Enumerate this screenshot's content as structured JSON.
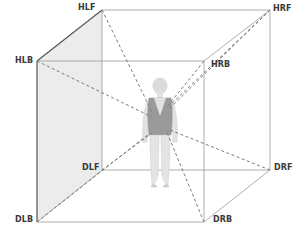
{
  "diagram": {
    "title": "",
    "colors": {
      "edge": "#8a8a8a",
      "edge_dark": "#555555",
      "dashed": "#7a7a7a",
      "left_face_fill": "#ececec",
      "figure_skin": "#e2e2e2",
      "figure_garment": "#9a9a9a",
      "label": "#3a3a3a"
    },
    "corners": {
      "HLF": {
        "label": "HLF",
        "x": 102,
        "y": 10
      },
      "HRF": {
        "label": "HRF",
        "x": 270,
        "y": 10
      },
      "HLB": {
        "label": "HLB",
        "x": 37,
        "y": 61
      },
      "HRB": {
        "label": "HRB",
        "x": 204,
        "y": 61
      },
      "DLF": {
        "label": "DLF",
        "x": 102,
        "y": 170
      },
      "DRF": {
        "label": "DRF",
        "x": 270,
        "y": 170
      },
      "DLB": {
        "label": "DLB",
        "x": 37,
        "y": 222
      },
      "DRB": {
        "label": "DRB",
        "x": 204,
        "y": 222
      }
    },
    "edges": [
      [
        "HLF",
        "HRF"
      ],
      [
        "HLB",
        "HRB"
      ],
      [
        "DLF",
        "DRF"
      ],
      [
        "DLB",
        "DRB"
      ],
      [
        "HLF",
        "HLB"
      ],
      [
        "HRF",
        "HRB"
      ],
      [
        "DLF",
        "DLB"
      ],
      [
        "DRF",
        "DRB"
      ],
      [
        "HLF",
        "DLF"
      ],
      [
        "HRF",
        "DRF"
      ],
      [
        "HLB",
        "DLB"
      ],
      [
        "HRB",
        "DRB"
      ]
    ],
    "dashed_lines_to_figure": [
      "HLF",
      "HRF",
      "HLB",
      "HRB",
      "DLF",
      "DRF",
      "DLB",
      "DRB"
    ],
    "figure": {
      "description": "standing woman seen from behind, wearing a low-back top",
      "center_x": 160
    }
  }
}
